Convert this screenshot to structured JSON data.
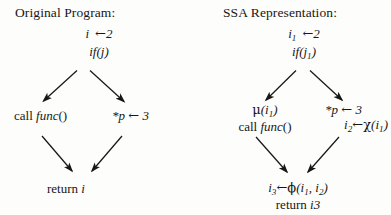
{
  "figure": {
    "caption_left": "Original Program:",
    "caption_right": "SSA Representation:",
    "ink_color": "#171717",
    "background_color": "#fdfdfc"
  },
  "left_diagram": {
    "title": "Original Program:",
    "nodes": {
      "entry_assign_var": "i",
      "entry_assign_arrow": "←",
      "entry_assign_value": "2",
      "branch_keyword": "if",
      "branch_condition": "(j)",
      "left_child": "call",
      "left_child_fn": "func",
      "left_child_parens": "()",
      "right_child_target": "*p",
      "right_child_arrow": "←",
      "right_child_value": "3",
      "exit_keyword": "return",
      "exit_value": "i"
    },
    "edges": [
      {
        "name": "entry-to-call",
        "from": "if(j)",
        "to": "call func()"
      },
      {
        "name": "entry-to-store",
        "from": "if(j)",
        "to": "*p <- 3"
      },
      {
        "name": "call-to-return",
        "from": "call func()",
        "to": "return i"
      },
      {
        "name": "store-to-return",
        "from": "*p <- 3",
        "to": "return i"
      }
    ]
  },
  "right_diagram": {
    "title": "SSA Representation:",
    "nodes": {
      "entry_assign_var": "i",
      "entry_assign_var_sub": "1",
      "entry_assign_arrow": "←",
      "entry_assign_value": "2",
      "branch_keyword": "if",
      "branch_open": "(j",
      "branch_sub": "1",
      "branch_close": ")",
      "mu_symbol": "μ",
      "mu_open": "(i",
      "mu_sub": "1",
      "mu_close": ")",
      "left_child": "call",
      "left_child_fn": "func",
      "left_child_parens": "()",
      "right_child_target": "*p",
      "right_child_arrow": "←",
      "right_child_value": "3",
      "chi_var": "i",
      "chi_var_sub": "2",
      "chi_arrow": "←",
      "chi_symbol": "χ",
      "chi_open": "(i",
      "chi_sub": "1",
      "chi_close": ")",
      "phi_var": "i",
      "phi_var_sub": "3",
      "phi_arrow": "←",
      "phi_symbol": "ϕ",
      "phi_open": "(i",
      "phi_arg1_sub": "1",
      "phi_comma": ", i",
      "phi_arg2_sub": "2",
      "phi_close": ")",
      "exit_keyword": "return",
      "exit_value": "i3"
    },
    "edges": [
      {
        "name": "entry-to-call",
        "from": "if(j1)",
        "to": "mu(i1) call func()"
      },
      {
        "name": "entry-to-store",
        "from": "if(j1)",
        "to": "*p <- 3"
      },
      {
        "name": "call-to-return",
        "from": "call func()",
        "to": "i3 <- phi(i1,i2)"
      },
      {
        "name": "store-to-return",
        "from": "i2 <- chi(i1)",
        "to": "i3 <- phi(i1,i2)"
      }
    ]
  }
}
